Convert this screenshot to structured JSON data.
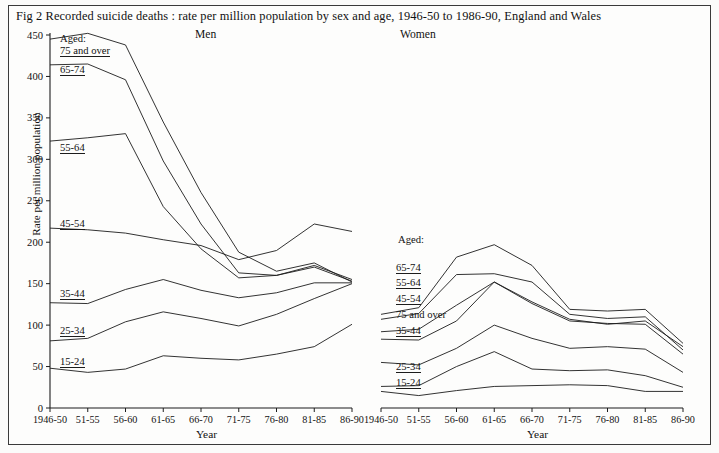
{
  "figure": {
    "title": "Fig 2   Recorded suicide deaths : rate per million population by sex and age, 1946-50 to 1986-90, England and Wales",
    "panel_men_title": "Men",
    "panel_women_title": "Women",
    "y_axis_label": "Rate per million population",
    "x_axis_label_men": "Year",
    "x_axis_label_women": "Year",
    "aged_caption_men": "Aged:",
    "aged_caption_women": "Aged:"
  },
  "labels": {
    "men": {
      "a75": "75 and over",
      "a65": "65-74",
      "a55": "55-64",
      "a45": "45-54",
      "a35": "35-44",
      "a25": "25-34",
      "a15": "15-24"
    },
    "women": {
      "a65": "65-74",
      "a55": "55-64",
      "a45": "45-54",
      "a75": "75 and over",
      "a35": "35-44",
      "a25": "25-34",
      "a15": "15-24"
    }
  },
  "ticks": {
    "y": [
      "450",
      "400",
      "350",
      "300",
      "250",
      "200",
      "150",
      "100",
      "50",
      "0"
    ],
    "x": [
      "1946-50",
      "51-55",
      "56-60",
      "61-65",
      "66-70",
      "71-75",
      "76-80",
      "81-85",
      "86-90"
    ]
  },
  "chart_data": {
    "type": "line",
    "title": "Fig 2   Recorded suicide deaths : rate per million population by sex and age, 1946-50 to 1986-90, England and Wales",
    "xlabel": "Year",
    "ylabel": "Rate per million population",
    "ylim": [
      0,
      450
    ],
    "grid": false,
    "legend_position": "inline-left-of-lines",
    "categories": [
      "1946-50",
      "51-55",
      "56-60",
      "61-65",
      "66-70",
      "71-75",
      "76-80",
      "81-85",
      "86-90"
    ],
    "panels": [
      {
        "name": "Men",
        "series": [
          {
            "name": "75 and over",
            "values": [
              445,
              452,
              438,
              345,
              260,
              188,
              165,
              175,
              152
            ]
          },
          {
            "name": "65-74",
            "values": [
              414,
              415,
              396,
              298,
              222,
              163,
              160,
              172,
              155
            ]
          },
          {
            "name": "55-64",
            "values": [
              322,
              326,
              331,
              243,
              192,
              157,
              160,
              170,
              153
            ]
          },
          {
            "name": "45-54",
            "values": [
              217,
              215,
              211,
              203,
              196,
              179,
              190,
              222,
              213
            ]
          },
          {
            "name": "35-44",
            "values": [
              127,
              126,
              143,
              155,
              142,
              133,
              139,
              151,
              151
            ]
          },
          {
            "name": "25-34",
            "values": [
              81,
              84,
              104,
              116,
              108,
              99,
              113,
              132,
              150
            ]
          },
          {
            "name": "15-24",
            "values": [
              48,
              43,
              47,
              63,
              60,
              58,
              65,
              74,
              101
            ]
          }
        ]
      },
      {
        "name": "Women",
        "series": [
          {
            "name": "65-74",
            "values": [
              113,
              121,
              182,
              197,
              172,
              119,
              117,
              119,
              78
            ]
          },
          {
            "name": "55-64",
            "values": [
              107,
              114,
              161,
              162,
              152,
              113,
              108,
              110,
              70
            ]
          },
          {
            "name": "45-54",
            "values": [
              92,
              95,
              124,
              152,
              128,
              107,
              101,
              105,
              74
            ]
          },
          {
            "name": "75 and over",
            "values": [
              83,
              82,
              105,
              152,
              126,
              105,
              102,
              101,
              65
            ]
          },
          {
            "name": "35-44",
            "values": [
              55,
              52,
              72,
              100,
              84,
              72,
              74,
              71,
              43
            ]
          },
          {
            "name": "25-34",
            "values": [
              26,
              27,
              50,
              68,
              47,
              45,
              46,
              39,
              25
            ]
          },
          {
            "name": "15-24",
            "values": [
              20,
              15,
              21,
              26,
              27,
              28,
              27,
              20,
              20
            ]
          }
        ]
      }
    ]
  }
}
